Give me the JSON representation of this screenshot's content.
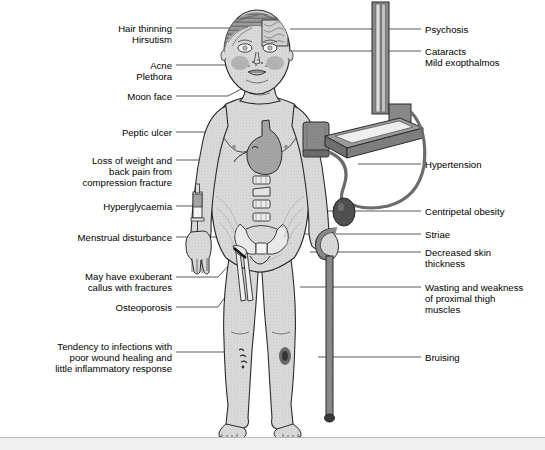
{
  "figure": {
    "title_alt": "Clinical features of Cushing's syndrome",
    "colors": {
      "skin_fill": "#d9d9d9",
      "skin_outline": "#2b2b2b",
      "organ_dark": "#8f8f8f",
      "organ_mid": "#bdbdbd",
      "hair": "#6e6e6e",
      "device_dark": "#707070",
      "device_mid": "#a8a8a8",
      "leader_line": "#5a5a5a",
      "bottom_band": "#efefef",
      "bottom_rule": "#b9b9b9",
      "text": "#000000"
    }
  },
  "left_labels": [
    {
      "id": "hair-thinning",
      "lines": [
        "Hair thinning",
        "Hirsutism"
      ],
      "text_right_x": 172,
      "top_y": 23,
      "align": "right",
      "leader": {
        "x1": 176,
        "y1": 28,
        "x2": 238,
        "y2": 28
      }
    },
    {
      "id": "acne-plethora",
      "lines": [
        "Acne",
        "Plethora"
      ],
      "text_right_x": 172,
      "top_y": 60,
      "align": "right",
      "leader": {
        "x1": 176,
        "y1": 65,
        "x2": 238,
        "y2": 65
      }
    },
    {
      "id": "moon-face",
      "lines": [
        "Moon face"
      ],
      "text_right_x": 172,
      "top_y": 91,
      "align": "right",
      "leader": {
        "x1": 176,
        "y1": 96,
        "x2": 246,
        "y2": 96
      }
    },
    {
      "id": "peptic-ulcer",
      "lines": [
        "Peptic ulcer"
      ],
      "text_right_x": 172,
      "top_y": 127,
      "align": "right",
      "leader": {
        "x1": 176,
        "y1": 132,
        "x2": 262,
        "y2": 132
      }
    },
    {
      "id": "loss-of-weight",
      "lines": [
        "Loss of weight and",
        "back pain from",
        "compression fracture"
      ],
      "text_right_x": 172,
      "top_y": 155,
      "align": "right",
      "leader": {
        "x1": 176,
        "y1": 160,
        "x2": 250,
        "y2": 160
      }
    },
    {
      "id": "hyperglycaemia",
      "lines": [
        "Hyperglycaemia"
      ],
      "text_right_x": 172,
      "top_y": 201,
      "align": "right",
      "leader": {
        "x1": 176,
        "y1": 206,
        "x2": 196,
        "y2": 206
      }
    },
    {
      "id": "menstrual-disturbance",
      "lines": [
        "Menstrual disturbance"
      ],
      "text_right_x": 172,
      "top_y": 232,
      "align": "right",
      "leader": {
        "x1": 176,
        "y1": 237,
        "x2": 232,
        "y2": 237
      }
    },
    {
      "id": "exuberant-callus",
      "lines": [
        "May have exuberant",
        "callus with fractures"
      ],
      "text_right_x": 172,
      "top_y": 271,
      "align": "right",
      "leader": {
        "x1": 176,
        "y1": 277,
        "x2": 222,
        "y2": 277
      }
    },
    {
      "id": "osteoporosis",
      "lines": [
        "Osteoporosis"
      ],
      "text_right_x": 172,
      "top_y": 302,
      "align": "right",
      "leader": {
        "x1": 176,
        "y1": 307,
        "x2": 222,
        "y2": 307
      }
    },
    {
      "id": "tendency-to-infections",
      "lines": [
        "Tendency to infections with",
        "poor wound healing and",
        "little inflammatory response"
      ],
      "text_right_x": 172,
      "top_y": 341,
      "align": "right",
      "leader": {
        "x1": 176,
        "y1": 352,
        "x2": 239,
        "y2": 352
      }
    }
  ],
  "right_labels": [
    {
      "id": "psychosis",
      "lines": [
        "Psychosis"
      ],
      "text_left_x": 425,
      "top_y": 24,
      "leader": {
        "x1": 390,
        "y1": 29,
        "x2": 421,
        "y2": 29
      }
    },
    {
      "id": "cataracts",
      "lines": [
        "Cataracts",
        "Mild exopthalmos"
      ],
      "text_left_x": 425,
      "top_y": 46,
      "leader": {
        "x1": 390,
        "y1": 51,
        "x2": 421,
        "y2": 51
      }
    },
    {
      "id": "hypertension",
      "lines": [
        "Hypertension"
      ],
      "text_left_x": 425,
      "top_y": 159,
      "leader": {
        "x1": 384,
        "y1": 164,
        "x2": 421,
        "y2": 164
      }
    },
    {
      "id": "centripetal-obesity",
      "lines": [
        "Centripetal obesity"
      ],
      "text_left_x": 425,
      "top_y": 206,
      "leader": {
        "x1": 375,
        "y1": 211,
        "x2": 421,
        "y2": 211
      }
    },
    {
      "id": "striae",
      "lines": [
        "Striae"
      ],
      "text_left_x": 425,
      "top_y": 229,
      "leader": {
        "x1": 375,
        "y1": 234,
        "x2": 421,
        "y2": 234
      }
    },
    {
      "id": "decreased-skin-thickness",
      "lines": [
        "Decreased skin",
        "thickness"
      ],
      "text_left_x": 425,
      "top_y": 247,
      "leader": {
        "x1": 375,
        "y1": 252,
        "x2": 421,
        "y2": 252
      }
    },
    {
      "id": "wasting-weakness",
      "lines": [
        "Wasting and weakness",
        "of proximal thigh",
        "muscles"
      ],
      "text_left_x": 425,
      "top_y": 282,
      "leader": {
        "x1": 375,
        "y1": 287,
        "x2": 421,
        "y2": 287
      }
    },
    {
      "id": "bruising",
      "lines": [
        "Bruising"
      ],
      "text_left_x": 425,
      "top_y": 352,
      "leader": {
        "x1": 375,
        "y1": 357,
        "x2": 421,
        "y2": 357
      }
    }
  ],
  "figure_parts": [
    {
      "id": "head",
      "name": "patient-head"
    },
    {
      "id": "brain-inset",
      "name": "brain-cortex-inset"
    },
    {
      "id": "face",
      "name": "moon-face"
    },
    {
      "id": "cheek-flush-left",
      "name": "cheek-plethora-patch"
    },
    {
      "id": "cheek-flush-right",
      "name": "cheek-acne-patch"
    },
    {
      "id": "torso",
      "name": "patient-torso"
    },
    {
      "id": "stomach",
      "name": "stomach-organ"
    },
    {
      "id": "vertebrae",
      "name": "vertebral-column"
    },
    {
      "id": "pelvis",
      "name": "pelvis-bone"
    },
    {
      "id": "striae-lines",
      "name": "abdominal-striae"
    },
    {
      "id": "bp-cuff",
      "name": "blood-pressure-cuff"
    },
    {
      "id": "sphygmomanometer",
      "name": "mercury-sphygmomanometer"
    },
    {
      "id": "bp-bulb",
      "name": "inflation-bulb"
    },
    {
      "id": "syringe",
      "name": "insulin-syringe"
    },
    {
      "id": "femur-fracture",
      "name": "femur-fracture-callus"
    },
    {
      "id": "cane",
      "name": "walking-cane"
    },
    {
      "id": "shin-lesions",
      "name": "shin-skin-infection"
    },
    {
      "id": "shin-bruise",
      "name": "shin-bruise"
    },
    {
      "id": "legs",
      "name": "patient-legs"
    }
  ]
}
